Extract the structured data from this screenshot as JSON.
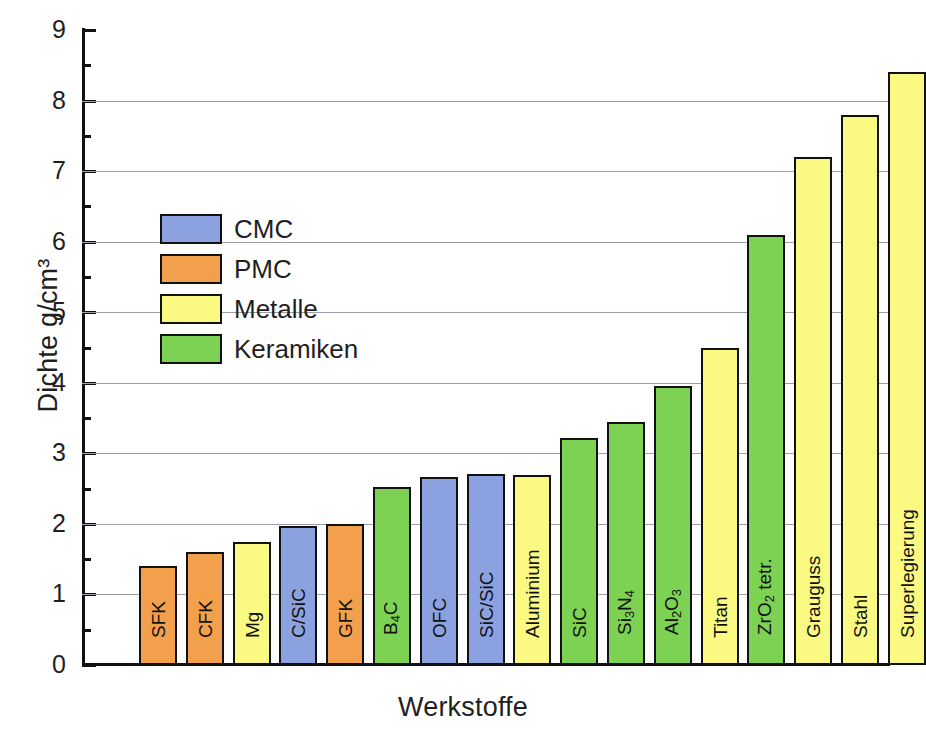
{
  "chart_data": {
    "type": "bar",
    "title": "",
    "xlabel": "Werkstoffe",
    "ylabel": "Dichte g/cm³",
    "ylim": [
      0,
      9
    ],
    "ytick_labels": [
      "0",
      "1",
      "2",
      "3",
      "4",
      "5",
      "6",
      "7",
      "8",
      "9"
    ],
    "ytick_values": [
      0,
      1,
      2,
      3,
      4,
      5,
      6,
      7,
      8,
      9
    ],
    "minor_tick_step": 0.5,
    "grid": "horizontal",
    "legend_position": "upper-left-inside",
    "categories": [
      "SFK",
      "CFK",
      "Mg",
      "C/SiC",
      "GFK",
      "B4C",
      "OFC",
      "SiC/SiC",
      "Aluminium",
      "SiC",
      "Si3N4",
      "Al2O3",
      "Titan",
      "ZrO2 tetr.",
      "Grauguss",
      "Stahl",
      "Superlegierung"
    ],
    "values": [
      1.4,
      1.6,
      1.75,
      1.97,
      2.0,
      2.52,
      2.67,
      2.71,
      2.7,
      3.22,
      3.45,
      3.95,
      4.5,
      6.1,
      7.2,
      7.8,
      8.4
    ],
    "bars": [
      {
        "label": "SFK",
        "label_html": "SFK",
        "value": 1.4,
        "group": "PMC"
      },
      {
        "label": "CFK",
        "label_html": "CFK",
        "value": 1.6,
        "group": "PMC"
      },
      {
        "label": "Mg",
        "label_html": "Mg",
        "value": 1.75,
        "group": "Metalle"
      },
      {
        "label": "C/SiC",
        "label_html": "C/SiC",
        "value": 1.97,
        "group": "CMC"
      },
      {
        "label": "GFK",
        "label_html": "GFK",
        "value": 2.0,
        "group": "PMC"
      },
      {
        "label": "B4C",
        "label_html": "B<sub>4</sub>C",
        "value": 2.52,
        "group": "Keramiken"
      },
      {
        "label": "OFC",
        "label_html": "OFC",
        "value": 2.67,
        "group": "CMC"
      },
      {
        "label": "SiC/SiC",
        "label_html": "SiC/SiC",
        "value": 2.71,
        "group": "CMC"
      },
      {
        "label": "Aluminium",
        "label_html": "Aluminium",
        "value": 2.7,
        "group": "Metalle"
      },
      {
        "label": "SiC",
        "label_html": "SiC",
        "value": 3.22,
        "group": "Keramiken"
      },
      {
        "label": "Si3N4",
        "label_html": "Si<sub>3</sub>N<sub>4</sub>",
        "value": 3.45,
        "group": "Keramiken"
      },
      {
        "label": "Al2O3",
        "label_html": "Al<sub>2</sub>O<sub>3</sub>",
        "value": 3.95,
        "group": "Keramiken"
      },
      {
        "label": "Titan",
        "label_html": "Titan",
        "value": 4.5,
        "group": "Metalle"
      },
      {
        "label": "ZrO2 tetr.",
        "label_html": "ZrO<sub>2</sub> tetr.",
        "value": 6.1,
        "group": "Keramiken"
      },
      {
        "label": "Grauguss",
        "label_html": "Grauguss",
        "value": 7.2,
        "group": "Metalle"
      },
      {
        "label": "Stahl",
        "label_html": "Stahl",
        "value": 7.8,
        "group": "Metalle"
      },
      {
        "label": "Superlegierung",
        "label_html": "Superlegierung",
        "value": 8.4,
        "group": "Metalle"
      }
    ],
    "legend": [
      {
        "label": "CMC",
        "color": "#8ca2e0"
      },
      {
        "label": "PMC",
        "color": "#f2a04c"
      },
      {
        "label": "Metalle",
        "color": "#fafa82"
      },
      {
        "label": "Keramiken",
        "color": "#7dd254"
      }
    ],
    "colors": {
      "CMC": "#8ca2e0",
      "PMC": "#f2a04c",
      "Metalle": "#fafa82",
      "Keramiken": "#7dd254",
      "axis": "#111111",
      "grid": "#9aa0a6",
      "background": "#ffffff"
    }
  }
}
